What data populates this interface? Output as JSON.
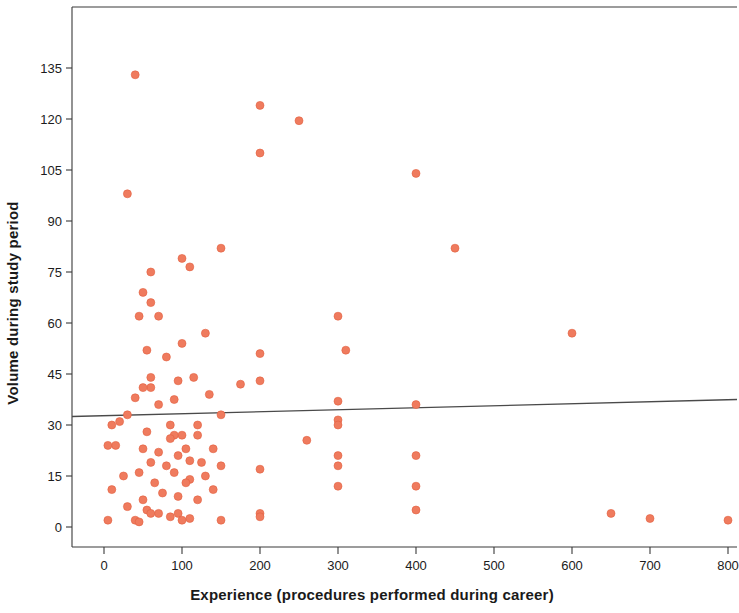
{
  "chart_data": {
    "type": "scatter",
    "title": "",
    "xlabel": "Experience (procedures performed during career)",
    "ylabel": "Volume during study period",
    "xlim": [
      -40,
      815
    ],
    "ylim": [
      -6,
      159
    ],
    "grid": false,
    "legend": null,
    "marker_color": "#ef7b5e",
    "marker_edge_color": "#e35f3f",
    "marker_size": 8,
    "axis_color": "#3a3a3a",
    "trendline": {
      "type": "linear-fit",
      "color": "#4a4a4a",
      "width": 1.3,
      "x_start": -40,
      "x_end": 815,
      "y_start": 32.5,
      "y_end": 37.5
    },
    "xticks": [
      0,
      100,
      200,
      300,
      400,
      500,
      600,
      700,
      800
    ],
    "xtick_labels": [
      "0",
      "100",
      "200",
      "300",
      "400",
      "500",
      "600",
      "700",
      "800"
    ],
    "yticks": [
      0,
      15,
      30,
      45,
      60,
      75,
      90,
      105,
      120,
      135
    ],
    "ytick_labels": [
      "0",
      "15",
      "30",
      "45",
      "60",
      "75",
      "90",
      "105",
      "120",
      "135"
    ],
    "points": [
      [
        40,
        133
      ],
      [
        200,
        124
      ],
      [
        250,
        119.5
      ],
      [
        200,
        110
      ],
      [
        400,
        104
      ],
      [
        30,
        98
      ],
      [
        150,
        82
      ],
      [
        450,
        82
      ],
      [
        100,
        79
      ],
      [
        60,
        75
      ],
      [
        110,
        76.5
      ],
      [
        50,
        69
      ],
      [
        60,
        66
      ],
      [
        45,
        62
      ],
      [
        70,
        62
      ],
      [
        300,
        62
      ],
      [
        130,
        57
      ],
      [
        100,
        54
      ],
      [
        55,
        52
      ],
      [
        310,
        52
      ],
      [
        200,
        51
      ],
      [
        600,
        57
      ],
      [
        80,
        50
      ],
      [
        60,
        44
      ],
      [
        115,
        44
      ],
      [
        175,
        42
      ],
      [
        95,
        43
      ],
      [
        200,
        43
      ],
      [
        135,
        39
      ],
      [
        60,
        41
      ],
      [
        50,
        41
      ],
      [
        40,
        38
      ],
      [
        90,
        37.5
      ],
      [
        70,
        36
      ],
      [
        300,
        37
      ],
      [
        400,
        36
      ],
      [
        30,
        33
      ],
      [
        20,
        31
      ],
      [
        150,
        33
      ],
      [
        300,
        31.5
      ],
      [
        10,
        30
      ],
      [
        85,
        30
      ],
      [
        120,
        30
      ],
      [
        55,
        28
      ],
      [
        300,
        30
      ],
      [
        5,
        24
      ],
      [
        15,
        24
      ],
      [
        100,
        27
      ],
      [
        120,
        27
      ],
      [
        260,
        25.5
      ],
      [
        90,
        27
      ],
      [
        85,
        26
      ],
      [
        50,
        23
      ],
      [
        105,
        23
      ],
      [
        140,
        23
      ],
      [
        70,
        22
      ],
      [
        95,
        21
      ],
      [
        400,
        21
      ],
      [
        300,
        21
      ],
      [
        110,
        19.5
      ],
      [
        125,
        19
      ],
      [
        60,
        19
      ],
      [
        80,
        18
      ],
      [
        150,
        18
      ],
      [
        200,
        17
      ],
      [
        300,
        18
      ],
      [
        45,
        16
      ],
      [
        90,
        16
      ],
      [
        130,
        15
      ],
      [
        25,
        15
      ],
      [
        110,
        14
      ],
      [
        65,
        13
      ],
      [
        105,
        13
      ],
      [
        300,
        12
      ],
      [
        400,
        12
      ],
      [
        10,
        11
      ],
      [
        140,
        11
      ],
      [
        75,
        10
      ],
      [
        95,
        9
      ],
      [
        50,
        8
      ],
      [
        120,
        8
      ],
      [
        30,
        6
      ],
      [
        55,
        5
      ],
      [
        60,
        4
      ],
      [
        70,
        4
      ],
      [
        85,
        3
      ],
      [
        95,
        4
      ],
      [
        5,
        2
      ],
      [
        40,
        2
      ],
      [
        45,
        1.5
      ],
      [
        100,
        2
      ],
      [
        110,
        2.5
      ],
      [
        150,
        2
      ],
      [
        200,
        4
      ],
      [
        200,
        3
      ],
      [
        400,
        5
      ],
      [
        650,
        4
      ],
      [
        700,
        2.5
      ],
      [
        800,
        2
      ]
    ]
  }
}
